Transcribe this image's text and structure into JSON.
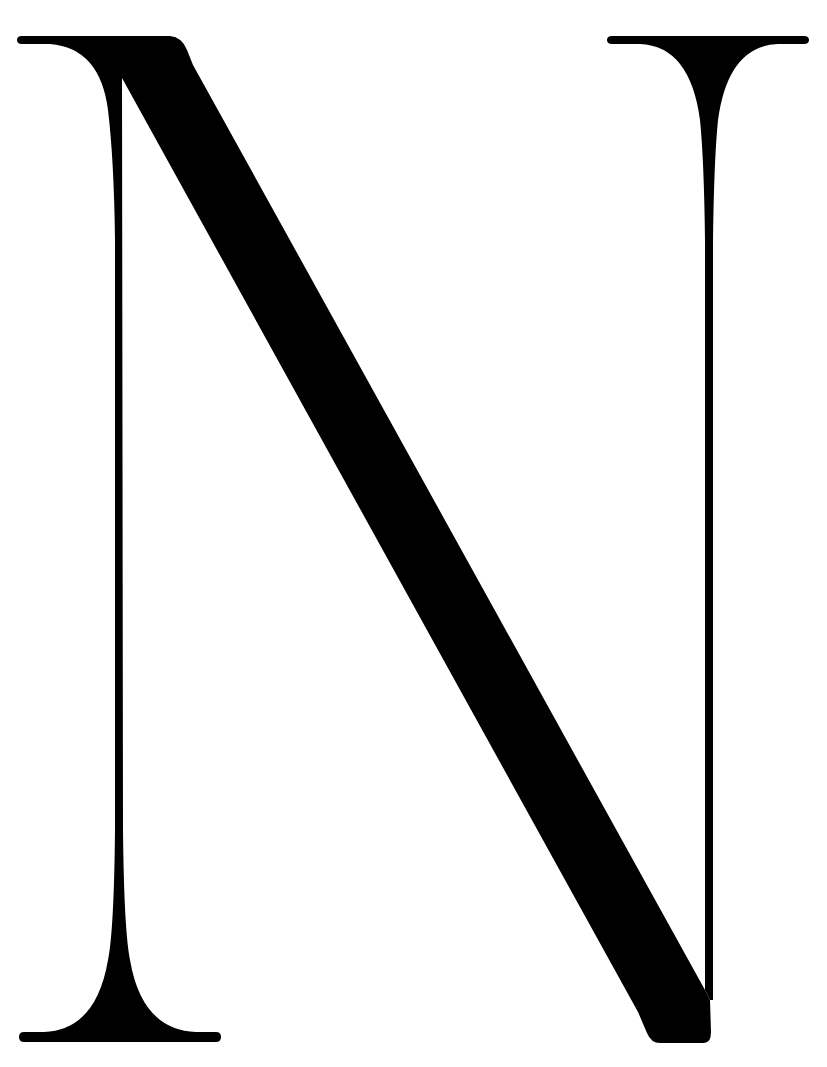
{
  "glyph": {
    "character": "N",
    "style": "high-contrast didone serif capital",
    "fill_color": "#000000",
    "background_color": "#ffffff"
  }
}
